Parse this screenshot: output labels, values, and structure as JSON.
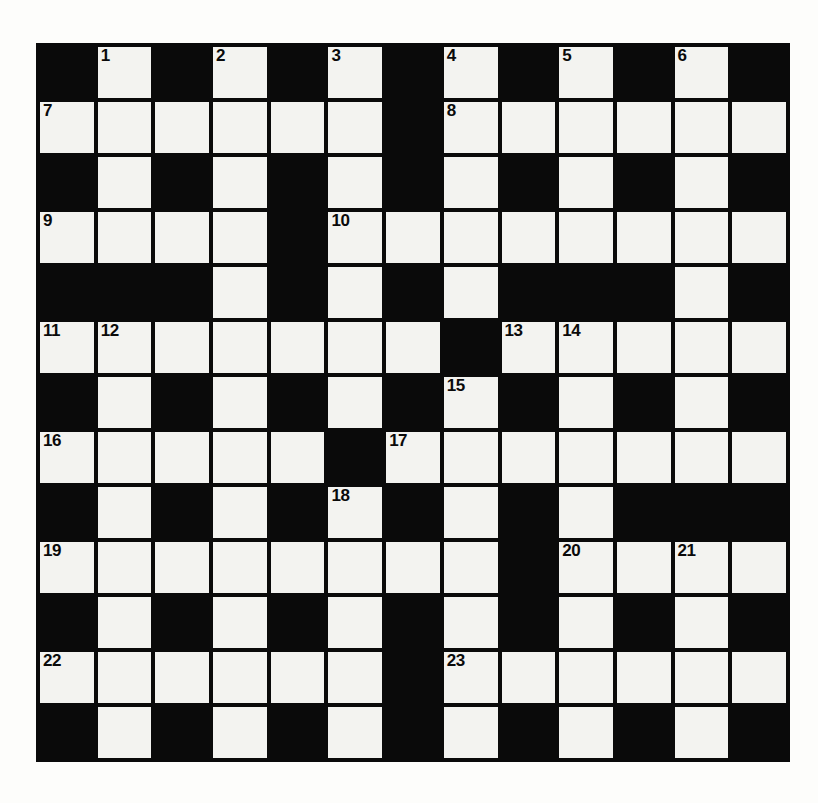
{
  "puzzle": {
    "kind": "crossword-grid",
    "rows": 13,
    "columns": 13,
    "colors": {
      "page_background": "#fdfdfb",
      "block_cell": "#0a0a0a",
      "light_cell": "#f3f3f0",
      "grid_line": "#0a0a0a",
      "number_text": "#0a0a0a"
    },
    "numbers_visible": [
      1,
      2,
      3,
      4,
      5,
      6,
      7,
      8,
      9,
      10,
      11,
      12,
      13,
      14,
      15,
      16,
      17,
      18,
      19,
      20,
      21,
      22,
      23
    ],
    "highest_number": 23,
    "grid": [
      [
        "block",
        "light",
        "block",
        "light",
        "block",
        "light",
        "block",
        "light",
        "block",
        "light",
        "block",
        "light",
        "block"
      ],
      [
        "light",
        "light",
        "light",
        "light",
        "light",
        "light",
        "block",
        "light",
        "light",
        "light",
        "light",
        "light",
        "light"
      ],
      [
        "block",
        "light",
        "block",
        "light",
        "block",
        "light",
        "block",
        "light",
        "block",
        "light",
        "block",
        "light",
        "block"
      ],
      [
        "light",
        "light",
        "light",
        "light",
        "block",
        "light",
        "light",
        "light",
        "light",
        "light",
        "light",
        "light",
        "light"
      ],
      [
        "block",
        "block",
        "block",
        "light",
        "block",
        "light",
        "block",
        "light",
        "block",
        "block",
        "block",
        "light",
        "block"
      ],
      [
        "light",
        "light",
        "light",
        "light",
        "light",
        "light",
        "light",
        "block",
        "light",
        "light",
        "light",
        "light",
        "light"
      ],
      [
        "block",
        "light",
        "block",
        "light",
        "block",
        "light",
        "block",
        "light",
        "block",
        "light",
        "block",
        "light",
        "block"
      ],
      [
        "light",
        "light",
        "light",
        "light",
        "light",
        "block",
        "light",
        "light",
        "light",
        "light",
        "light",
        "light",
        "light"
      ],
      [
        "block",
        "light",
        "block",
        "light",
        "block",
        "light",
        "block",
        "light",
        "block",
        "light",
        "block",
        "block",
        "block"
      ],
      [
        "light",
        "light",
        "light",
        "light",
        "light",
        "light",
        "light",
        "light",
        "block",
        "light",
        "light",
        "light",
        "light"
      ],
      [
        "block",
        "light",
        "block",
        "light",
        "block",
        "light",
        "block",
        "light",
        "block",
        "light",
        "block",
        "light",
        "block"
      ],
      [
        "light",
        "light",
        "light",
        "light",
        "light",
        "light",
        "block",
        "light",
        "light",
        "light",
        "light",
        "light",
        "light"
      ],
      [
        "block",
        "light",
        "block",
        "light",
        "block",
        "light",
        "block",
        "light",
        "block",
        "light",
        "block",
        "light",
        "block"
      ]
    ],
    "numbers": [
      {
        "n": 1,
        "row": 0,
        "col": 1
      },
      {
        "n": 2,
        "row": 0,
        "col": 3
      },
      {
        "n": 3,
        "row": 0,
        "col": 5
      },
      {
        "n": 4,
        "row": 0,
        "col": 7
      },
      {
        "n": 5,
        "row": 0,
        "col": 9
      },
      {
        "n": 6,
        "row": 0,
        "col": 11
      },
      {
        "n": 7,
        "row": 1,
        "col": 0
      },
      {
        "n": 8,
        "row": 1,
        "col": 7
      },
      {
        "n": 9,
        "row": 3,
        "col": 0
      },
      {
        "n": 10,
        "row": 3,
        "col": 5
      },
      {
        "n": 11,
        "row": 5,
        "col": 0
      },
      {
        "n": 12,
        "row": 5,
        "col": 1
      },
      {
        "n": 13,
        "row": 5,
        "col": 8
      },
      {
        "n": 14,
        "row": 5,
        "col": 9
      },
      {
        "n": 15,
        "row": 6,
        "col": 7
      },
      {
        "n": 16,
        "row": 7,
        "col": 0
      },
      {
        "n": 17,
        "row": 7,
        "col": 6
      },
      {
        "n": 18,
        "row": 8,
        "col": 5
      },
      {
        "n": 19,
        "row": 9,
        "col": 0
      },
      {
        "n": 20,
        "row": 9,
        "col": 9
      },
      {
        "n": 21,
        "row": 9,
        "col": 11
      },
      {
        "n": 22,
        "row": 11,
        "col": 0
      },
      {
        "n": 23,
        "row": 11,
        "col": 7
      }
    ]
  }
}
